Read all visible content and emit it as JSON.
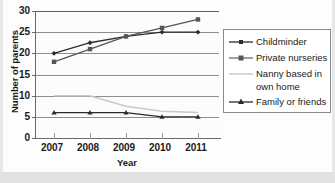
{
  "chart_data": {
    "type": "line",
    "title": "",
    "xlabel": "Year",
    "ylabel": "Number of parents",
    "categories": [
      "2007",
      "2008",
      "2009",
      "2010",
      "2011"
    ],
    "x": [
      2007,
      2008,
      2009,
      2010,
      2011
    ],
    "ylim": [
      0,
      30
    ],
    "yticks": [
      "0",
      "5",
      "10",
      "15",
      "20",
      "25",
      "30"
    ],
    "grid": true,
    "legend_position": "right",
    "series": [
      {
        "name": "Childminder",
        "values": [
          20,
          22.5,
          24,
          25,
          25
        ],
        "color": "#2b2b2b",
        "marker": "diamond"
      },
      {
        "name": "Private nurseries",
        "values": [
          18,
          21,
          24,
          26,
          28
        ],
        "color": "#55555a",
        "marker": "square"
      },
      {
        "name": "Nanny based in own home",
        "values": [
          10,
          10,
          7.5,
          6.3,
          6
        ],
        "color": "#c9c9c9",
        "marker": "none"
      },
      {
        "name": "Family or friends",
        "values": [
          6,
          6,
          6,
          5,
          5
        ],
        "color": "#2b2b2b",
        "marker": "triangle"
      }
    ]
  },
  "legend": {
    "entries": [
      {
        "label": "Childminder",
        "label_line2": ""
      },
      {
        "label": "Private nurseries",
        "label_line2": ""
      },
      {
        "label": "Nanny based in",
        "label_line2": "own home"
      },
      {
        "label": "Family or friends",
        "label_line2": ""
      }
    ]
  },
  "axes": {
    "y_title": "Number of parents",
    "x_title": "Year",
    "y_labels": [
      "30",
      "25",
      "20",
      "15",
      "10",
      "5",
      "0"
    ],
    "x_labels": [
      "2007",
      "2008",
      "2009",
      "2010",
      "2011"
    ]
  }
}
